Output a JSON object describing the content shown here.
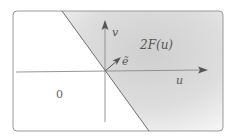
{
  "diagram": {
    "axes": {
      "horizontal_label": "u",
      "vertical_label": "v"
    },
    "vector_label": "ẽ",
    "region_labels": {
      "shaded": "2F(u)",
      "unshaded": "0"
    },
    "colors": {
      "frame": "#9a9a9a",
      "axis": "#8a8a8a",
      "boundary_line": "#6e6e6e",
      "shade_dark": "#c8c8c8",
      "shade_light": "#f2f2f2",
      "text": "#555555"
    }
  }
}
